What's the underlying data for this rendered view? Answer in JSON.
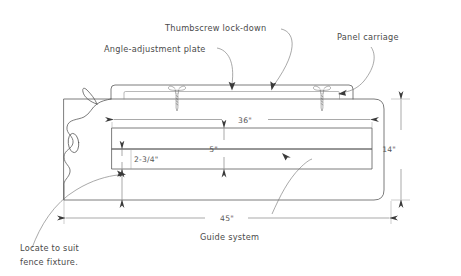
{
  "drawing": {
    "title": "Panel-cutting sled / guide system assembly drawing",
    "background_color": "#ffffff",
    "line_color": "#5a5a5a",
    "text_color": "#4a4a4a",
    "width": 461,
    "height": 276
  },
  "annotations": {
    "thumbscrew": "Thumbscrew lock-down",
    "angle_plate": "Angle-adjustment plate",
    "panel_carriage": "Panel carriage",
    "guide_system": "Guide system",
    "locate_line1": "Locate to suit",
    "locate_line2": "fence fixture."
  },
  "dimensions": {
    "length_36": "36\"",
    "length_45": "45\"",
    "height_14": "14\"",
    "height_5": "5\"",
    "height_2_3_4": "2-3/4\""
  },
  "icons": {
    "screw_left": "thumbscrew-icon",
    "screw_right": "thumbscrew-icon"
  }
}
